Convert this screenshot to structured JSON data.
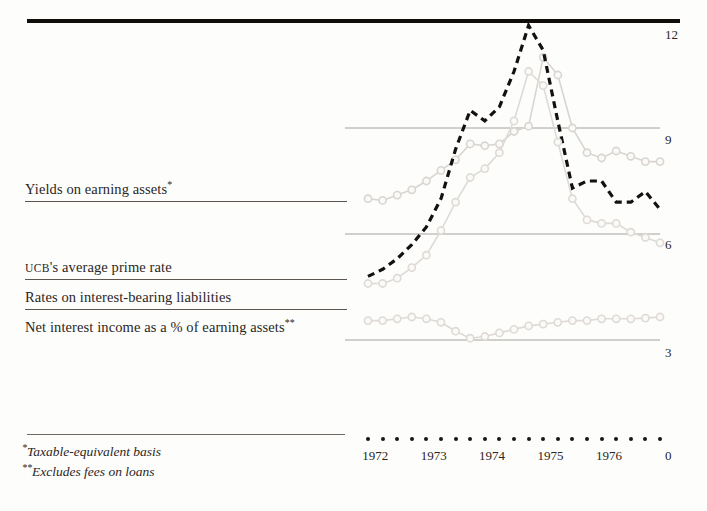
{
  "figure": {
    "title": "",
    "top_rule_color": "#100d0b"
  },
  "legend": {
    "items": [
      {
        "label": "Yields on earning assets",
        "mark": "*",
        "name": "yields-on-earning-assets"
      },
      {
        "label": "UCB's average prime rate",
        "mark": "",
        "name": "ucb-average-prime-rate"
      },
      {
        "label": "Rates on interest-bearing liabilities",
        "mark": "",
        "name": "rates-on-interest-bearing-liabilities"
      },
      {
        "label": "Net interest income as a % of earning assets",
        "mark": "**",
        "name": "net-interest-income-pct-earning-assets"
      }
    ]
  },
  "footnotes": [
    {
      "mark": "*",
      "text": "Taxable-equivalent basis"
    },
    {
      "mark": "**",
      "text": "Excludes fees on loans"
    }
  ],
  "axes": {
    "y_ticks": [
      "12",
      "9",
      "6",
      "3",
      "0"
    ],
    "x_ticks": [
      "1972",
      "1973",
      "1974",
      "1975",
      "1976"
    ]
  },
  "chart_data": {
    "type": "line",
    "title": "",
    "xlabel": "",
    "ylabel": "",
    "ylim": [
      0,
      12
    ],
    "grid": true,
    "legend_position": "left-block",
    "x": [
      "1972Q1",
      "1972Q2",
      "1972Q3",
      "1972Q4",
      "1973Q1",
      "1973Q2",
      "1973Q3",
      "1973Q4",
      "1974Q1",
      "1974Q2",
      "1974Q3",
      "1974Q4",
      "1975Q1",
      "1975Q2",
      "1975Q3",
      "1975Q4",
      "1976Q1",
      "1976Q2",
      "1976Q3",
      "1976Q4",
      "1977Q1"
    ],
    "x_tick_labels": [
      "1972",
      "1973",
      "1974",
      "1975",
      "1976"
    ],
    "x_tick_positions": [
      0.5,
      4.5,
      8.5,
      12.5,
      16.5
    ],
    "series": [
      {
        "name": "Yields on earning assets",
        "style": "solid-markers",
        "color": "#d9d6d1",
        "marker": "circle",
        "values": [
          7.0,
          6.95,
          7.1,
          7.25,
          7.5,
          7.8,
          8.1,
          8.55,
          8.5,
          8.55,
          8.9,
          9.05,
          11.0,
          10.5,
          9.0,
          8.3,
          8.15,
          8.35,
          8.2,
          8.05,
          8.05
        ]
      },
      {
        "name": "UCB's average prime rate",
        "style": "dashed",
        "color": "#141110",
        "marker": "none",
        "values": [
          4.8,
          5.0,
          5.3,
          5.7,
          6.2,
          7.0,
          8.4,
          9.5,
          9.2,
          9.6,
          10.6,
          11.9,
          11.2,
          9.2,
          7.3,
          7.5,
          7.5,
          6.9,
          6.9,
          7.2,
          6.7
        ]
      },
      {
        "name": "Rates on interest-bearing liabilities",
        "style": "solid-markers",
        "color": "#dedbd6",
        "marker": "circle",
        "values": [
          4.6,
          4.6,
          4.75,
          5.05,
          5.4,
          6.1,
          6.9,
          7.6,
          7.85,
          8.3,
          9.2,
          10.6,
          10.2,
          8.6,
          7.0,
          6.4,
          6.3,
          6.3,
          6.05,
          5.9,
          5.75
        ]
      },
      {
        "name": "Net interest income as a % of earning assets",
        "style": "solid-markers",
        "color": "#dedbd6",
        "marker": "circle",
        "values": [
          3.55,
          3.55,
          3.6,
          3.65,
          3.6,
          3.5,
          3.25,
          3.05,
          3.1,
          3.2,
          3.3,
          3.4,
          3.45,
          3.5,
          3.55,
          3.55,
          3.6,
          3.6,
          3.6,
          3.62,
          3.65
        ]
      }
    ]
  }
}
